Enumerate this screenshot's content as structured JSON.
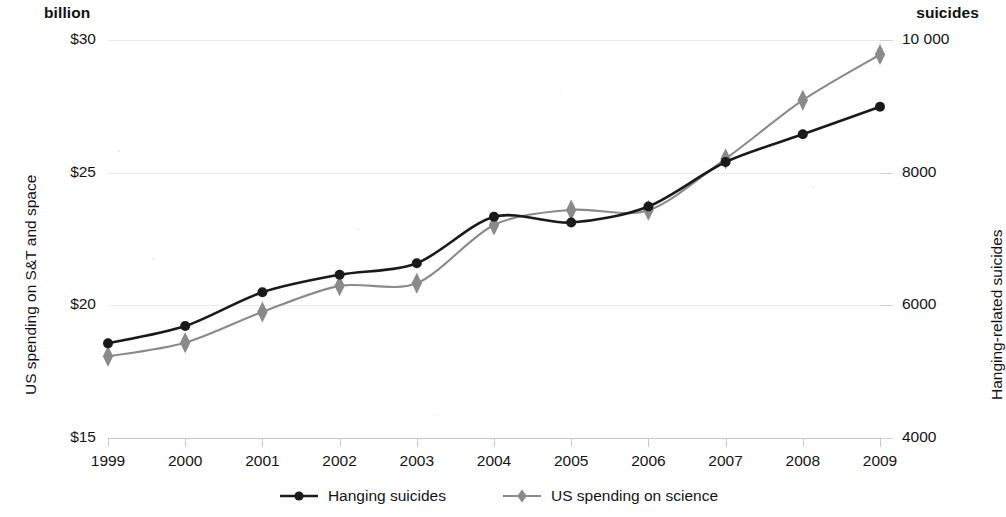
{
  "header": {
    "left_unit": "billion",
    "right_unit": "suicides"
  },
  "axes": {
    "y_left_title": "US spending on S&T and space",
    "y_right_title": "Hanging-related suicides",
    "y_left_ticks": [
      "$30",
      "$25",
      "$20",
      "$15"
    ],
    "y_right_ticks": [
      "10 000",
      "8000",
      "6000",
      "4000"
    ],
    "x_ticks": [
      "1999",
      "2000",
      "2001",
      "2002",
      "2003",
      "2004",
      "2005",
      "2006",
      "2007",
      "2008",
      "2009"
    ]
  },
  "legend": {
    "items": [
      {
        "label": "Hanging suicides",
        "marker": "circle-marker",
        "color": "#1a1a1a"
      },
      {
        "label": "US spending on science",
        "marker": "diamond-marker",
        "color": "#8a8a8a"
      }
    ]
  },
  "chart_data": {
    "type": "line",
    "title": "",
    "subtitle": "",
    "xlabel": "",
    "x": [
      1999,
      2000,
      2001,
      2002,
      2003,
      2004,
      2005,
      2006,
      2007,
      2008,
      2009
    ],
    "categories": [
      "1999",
      "2000",
      "2001",
      "2002",
      "2003",
      "2004",
      "2005",
      "2006",
      "2007",
      "2008",
      "2009"
    ],
    "grid": true,
    "legend_position": "bottom",
    "series": [
      {
        "name": "Hanging suicides",
        "axis": "right",
        "ylabel": "Hanging-related suicides",
        "unit": "suicides",
        "ylim": [
          4000,
          10000
        ],
        "ytick_values": [
          4000,
          6000,
          8000,
          10000
        ],
        "color": "#1a1a1a",
        "marker": "circle",
        "values": [
          5427,
          5688,
          6198,
          6462,
          6635,
          7336,
          7248,
          7491,
          8161,
          8578,
          8995
        ]
      },
      {
        "name": "US spending on science",
        "axis": "left",
        "ylabel": "US spending on S&T and space",
        "unit": "billion USD",
        "ylim": [
          15,
          30
        ],
        "ytick_values": [
          15,
          20,
          25,
          30
        ],
        "color": "#8a8a8a",
        "marker": "diamond",
        "values": [
          18.079,
          18.594,
          19.753,
          20.734,
          20.831,
          23.029,
          23.597,
          23.584,
          25.525,
          27.731,
          29.449
        ]
      }
    ]
  }
}
